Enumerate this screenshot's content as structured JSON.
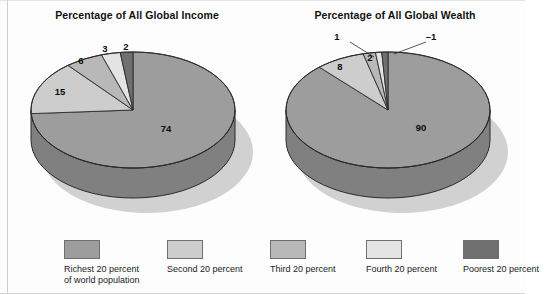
{
  "figure": {
    "background": "#fdfdfd",
    "text_color": "#111111"
  },
  "palette": {
    "richest": "#9d9d9d",
    "second": "#cdcdcd",
    "third": "#b8b8b8",
    "fourth": "#e4e4e4",
    "poorest": "#707070",
    "side_wall": "#808080",
    "shadow": "#c9c9c9",
    "outline": "#2b2b2b"
  },
  "charts": [
    {
      "id": "income",
      "title": "Percentage of All Global Income",
      "labels": [
        "74",
        "15",
        "6",
        "3",
        "2"
      ]
    },
    {
      "id": "wealth",
      "title": "Percentage of All Global Wealth",
      "labels": [
        "90",
        "8",
        "2",
        "1",
        "–1"
      ]
    }
  ],
  "legend": {
    "items": [
      {
        "label": "Richest 20 percent\nof world population",
        "color": "#9d9d9d"
      },
      {
        "label": "Second 20 percent",
        "color": "#cdcdcd"
      },
      {
        "label": "Third 20 percent",
        "color": "#b8b8b8"
      },
      {
        "label": "Fourth 20 percent",
        "color": "#e4e4e4"
      },
      {
        "label": "Poorest 20 percent",
        "color": "#707070"
      }
    ]
  },
  "chart_data": [
    {
      "type": "pie",
      "title": "Percentage of All Global Income",
      "categories": [
        "Richest 20 percent of world population",
        "Second 20 percent",
        "Third 20 percent",
        "Fourth 20 percent",
        "Poorest 20 percent"
      ],
      "values": [
        74,
        15,
        6,
        3,
        2
      ],
      "value_labels": [
        "74",
        "15",
        "6",
        "3",
        "2"
      ],
      "unit": "percent",
      "legend_position": "bottom",
      "grid": false,
      "three_d": true,
      "xlabel": "",
      "ylabel": ""
    },
    {
      "type": "pie",
      "title": "Percentage of All Global Wealth",
      "categories": [
        "Richest 20 percent of world population",
        "Second 20 percent",
        "Third 20 percent",
        "Fourth 20 percent",
        "Poorest 20 percent"
      ],
      "values": [
        90,
        8,
        2,
        1,
        -1
      ],
      "value_labels": [
        "90",
        "8",
        "2",
        "1",
        "–1"
      ],
      "unit": "percent",
      "legend_position": "bottom",
      "grid": false,
      "three_d": true,
      "xlabel": "",
      "ylabel": ""
    }
  ]
}
